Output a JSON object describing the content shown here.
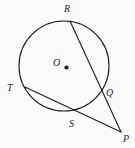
{
  "figure": {
    "kind": "circle-geometry-diagram",
    "background_color": "#fbfbfa",
    "stroke_color": "#1b1b1b",
    "label_color": "#1b1b1b",
    "circle": {
      "name": "circle-O",
      "center": {
        "x": 64,
        "y": 66
      },
      "radius": 45
    },
    "center_dot": {
      "name": "center-point-O",
      "x": 66.5,
      "y": 67.5,
      "r": 2.1
    },
    "points": [
      {
        "id": "R",
        "label": "R",
        "x": 70,
        "y": 21,
        "label_x": 64,
        "label_y": 4,
        "on_circle": true
      },
      {
        "id": "T",
        "label": "T",
        "x": 25,
        "y": 87,
        "label_x": 7,
        "label_y": 83,
        "on_circle": true
      },
      {
        "id": "Q",
        "label": "Q",
        "x": 104,
        "y": 92,
        "label_x": 106,
        "label_y": 88,
        "on_circle": true
      },
      {
        "id": "S",
        "label": "S",
        "x": 76,
        "y": 110,
        "label_x": 69,
        "label_y": 119,
        "on_circle": true
      },
      {
        "id": "O",
        "label": "O",
        "x": 66,
        "y": 67,
        "label_x": 53,
        "label_y": 58,
        "on_circle": false
      },
      {
        "id": "P",
        "label": "P",
        "x": 121,
        "y": 132,
        "label_x": 123,
        "label_y": 134,
        "on_circle": false
      }
    ],
    "segments": [
      {
        "id": "RP",
        "name": "secant-R-to-P",
        "from": "R",
        "to": "P"
      },
      {
        "id": "TP",
        "name": "secant-T-to-P",
        "from": "T",
        "to": "P"
      }
    ]
  }
}
